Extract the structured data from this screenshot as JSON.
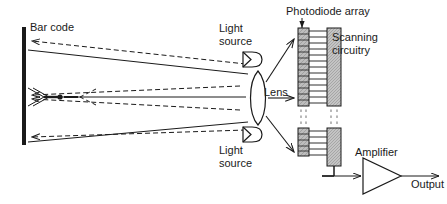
{
  "figure": {
    "type": "schematic-diagram",
    "width": 447,
    "height": 204,
    "background_color": "#ffffff",
    "line_color": "#1a1a1a",
    "fill_gray": "#b3b3b3",
    "fill_light_gray": "#d9d9d9"
  },
  "labels": {
    "barcode": "Bar code",
    "light_source_top": "Light\nsource",
    "light_source_bottom": "Light\nsource",
    "lens": "Lens",
    "photodiode_array": "Photodiode array",
    "scanning_circuitry": "Scanning\ncircuitry",
    "amplifier": "Amplifier",
    "output": "Output"
  },
  "components": {
    "barcode_bar": {
      "x": 22,
      "y": 27,
      "width": 4,
      "height": 118
    },
    "lens": {
      "cx": 258,
      "cy": 98,
      "rx": 9,
      "ry": 27
    },
    "light_source_top": {
      "cx": 252,
      "cy": 59,
      "width": 20,
      "height": 15
    },
    "light_source_bottom": {
      "cx": 252,
      "cy": 134,
      "width": 20,
      "height": 15
    },
    "photodiode_array_upper": {
      "x": 298,
      "y": 28,
      "width": 11,
      "height": 78,
      "cells": 13
    },
    "photodiode_array_lower": {
      "x": 298,
      "y": 128,
      "width": 11,
      "height": 28,
      "cells": 5
    },
    "scanning_circuitry_upper": {
      "x": 327,
      "y": 28,
      "width": 14,
      "height": 78
    },
    "scanning_circuitry_lower": {
      "x": 327,
      "y": 128,
      "width": 14,
      "height": 38
    },
    "amplifier": {
      "x": 363,
      "y": 158,
      "width": 38,
      "height": 36
    }
  },
  "rays": {
    "incoming_style": "dashed",
    "outgoing_style": "solid",
    "count_dashed": 4,
    "count_solid": 3,
    "convergence_point": {
      "x": 60,
      "y": 97
    },
    "beams_to_arrays": 3
  }
}
